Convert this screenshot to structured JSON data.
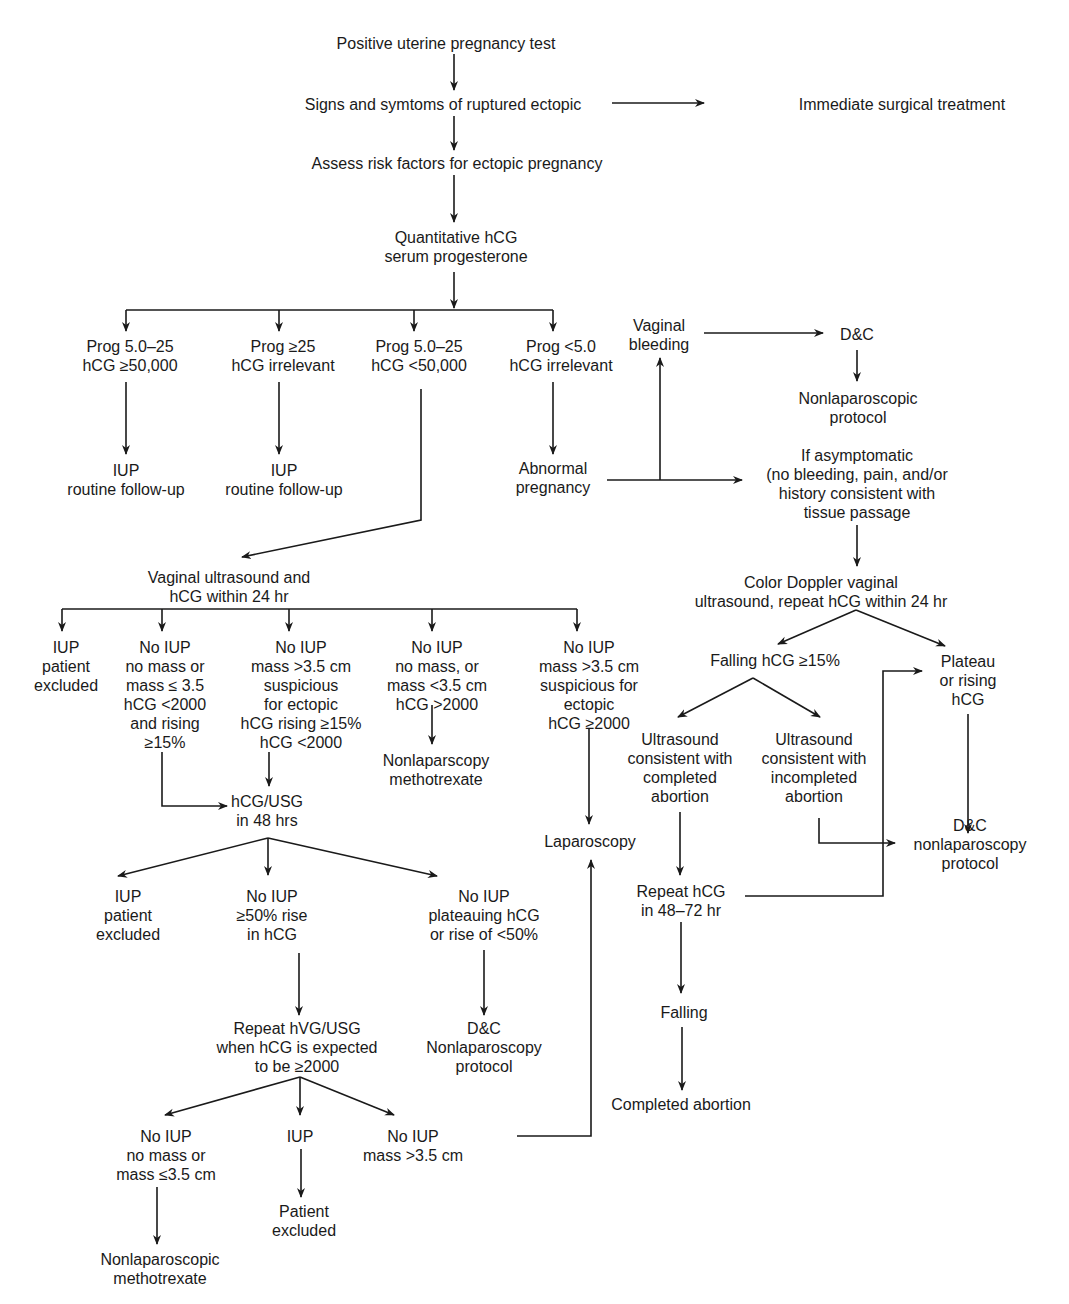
{
  "diagram": {
    "type": "flowchart",
    "nodes": {
      "positive_test": [
        "Positive uterine pregnancy test"
      ],
      "signs_ruptured": [
        "Signs and symtoms of ruptured ectopic"
      ],
      "immediate_surgery": [
        "Immediate  surgical treatment"
      ],
      "assess_risk": [
        "Assess risk factors for ectopic pregnancy"
      ],
      "quant_hcg": [
        "Quantitative hCG",
        "serum progesterone"
      ],
      "prog_a": [
        "Prog 5.0–25",
        "hCG ≥50,000"
      ],
      "prog_b": [
        "Prog ≥25",
        "hCG irrelevant"
      ],
      "prog_c": [
        "Prog 5.0–25",
        "hCG <50,000"
      ],
      "prog_d": [
        "Prog <5.0",
        "hCG irrelevant"
      ],
      "iup_a": [
        "IUP",
        "routine follow-up"
      ],
      "iup_b": [
        "IUP",
        "routine follow-up"
      ],
      "abnormal_preg": [
        "Abnormal",
        "pregnancy"
      ],
      "vaginal_bleeding": [
        "Vaginal",
        "bleeding"
      ],
      "dc_top": [
        "D&C"
      ],
      "nonlap_protocol_top": [
        "Nonlaparoscopic",
        "protocol"
      ],
      "if_asymptomatic": [
        "If asymptomatic",
        "(no bleeding, pain, and/or",
        "history consistent with",
        "tissue passage"
      ],
      "color_doppler": [
        "Color Doppler vaginal",
        "ultrasound, repeat hCG within 24 hr"
      ],
      "falling_hcg_15": [
        "Falling hCG ≥15%"
      ],
      "plateau_rising": [
        "Plateau",
        "or rising",
        "hCG"
      ],
      "us_completed": [
        "Ultrasound",
        "consistent with",
        "completed",
        "abortion"
      ],
      "us_incompleted": [
        "Ultrasound",
        "consistent with",
        "incompleted",
        "abortion"
      ],
      "dc_nonlap_right": [
        "D&C",
        "nonlaparoscopy",
        "protocol"
      ],
      "repeat_hcg_4872": [
        "Repeat hCG",
        "in 48–72 hr"
      ],
      "falling": [
        "Falling"
      ],
      "completed_abortion": [
        "Completed abortion"
      ],
      "vaginal_us": [
        "Vaginal ultrasound and",
        "hCG within 24 hr"
      ],
      "vu_1": [
        "IUP",
        "patient",
        "excluded"
      ],
      "vu_2": [
        "No IUP",
        "no mass or",
        "mass ≤ 3.5",
        "hCG <2000",
        "and rising",
        "≥15%"
      ],
      "vu_3": [
        "No IUP",
        "mass >3.5 cm",
        "suspicious",
        "for ectopic",
        "hCG rising ≥15%",
        "hCG <2000"
      ],
      "vu_4": [
        "No IUP",
        "no mass, or",
        "mass <3.5 cm",
        "hCG >2000"
      ],
      "vu_5": [
        "No IUP",
        "mass >3.5 cm",
        "suspicious for",
        "ectopic",
        "hCG ≥2000"
      ],
      "nonlap_mtx_mid": [
        "Nonlaparscopy",
        "methotrexate"
      ],
      "laparoscopy": [
        "Laparoscopy"
      ],
      "hcg_usg_48": [
        "hCG/USG",
        "in 48 hrs"
      ],
      "r48_1": [
        "IUP",
        "patient",
        "excluded"
      ],
      "r48_2": [
        "No IUP",
        "≥50% rise",
        "in hCG"
      ],
      "r48_3": [
        "No IUP",
        "plateauing hCG",
        "or rise of <50%"
      ],
      "repeat_hvg": [
        "Repeat hVG/USG",
        "when hCG is expected",
        "to be  ≥2000"
      ],
      "dc_nonlap_mid": [
        "D&C",
        "Nonlaparoscopy",
        "protocol"
      ],
      "rep_1": [
        "No IUP",
        "no mass or",
        "mass ≤3.5 cm"
      ],
      "rep_2": [
        "IUP"
      ],
      "rep_3": [
        "No IUP",
        "mass >3.5 cm"
      ],
      "patient_excluded": [
        "Patient",
        "excluded"
      ],
      "nonlap_mtx_bottom": [
        "Nonlaparoscopic",
        "methotrexate"
      ]
    }
  }
}
